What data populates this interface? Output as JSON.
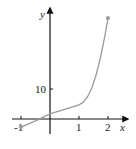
{
  "chart_data": {
    "type": "line",
    "title": "",
    "xlabel": "x",
    "ylabel": "y",
    "x_ticks": [
      -1,
      1,
      2
    ],
    "x_tick_labels": [
      "-1",
      "1",
      "2"
    ],
    "y_ticks": [
      10
    ],
    "y_tick_labels": [
      "10"
    ],
    "xlim": [
      -1.3,
      2.6
    ],
    "ylim": [
      -4,
      39
    ],
    "grid": false,
    "legend": null,
    "series": [
      {
        "name": "f(x)",
        "color": "#9a9a9a",
        "points": [
          [
            -1,
            -2.7
          ],
          [
            -0.5,
            -0.6
          ],
          [
            0,
            1.7
          ],
          [
            0.5,
            3.2
          ],
          [
            1,
            4.7
          ],
          [
            1.15,
            5.6
          ],
          [
            1.3,
            7.5
          ],
          [
            1.45,
            10.5
          ],
          [
            1.6,
            15
          ],
          [
            1.75,
            21
          ],
          [
            1.9,
            28
          ],
          [
            2,
            33.7
          ]
        ],
        "endpoints": [
          [
            -1,
            -2.7
          ],
          [
            2,
            33.7
          ]
        ]
      }
    ]
  }
}
